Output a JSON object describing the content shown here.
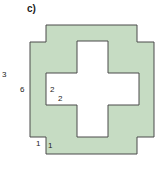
{
  "title": "c)",
  "shape": {
    "fill": "#c6dcc3",
    "stroke": "#4a4a4a"
  },
  "labels": {
    "outer_left": "3",
    "inner_left": "6",
    "cross_a": "2",
    "cross_b": "2",
    "step_a": "1",
    "step_b": "1"
  }
}
